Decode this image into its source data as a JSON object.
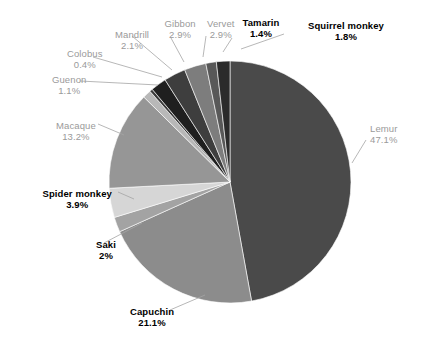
{
  "chart_data": {
    "type": "pie",
    "title": "",
    "subtitle": "",
    "xlabel": "",
    "ylabel": "",
    "legend_position": "none",
    "grid": false,
    "units": "percent",
    "categories": [
      "Lemur",
      "Capuchin",
      "Macaque",
      "Spider monkey",
      "Gibbon",
      "Vervet",
      "Mandrill",
      "Saki",
      "Squirrel monkey",
      "Tamarin",
      "Guenon",
      "Colobus"
    ],
    "values": [
      47.1,
      21.1,
      13.2,
      3.9,
      2.9,
      2.9,
      2.1,
      2,
      1.8,
      1.4,
      1.1,
      0.4
    ],
    "slices": [
      {
        "name": "Lemur",
        "value": 47.1,
        "label": "Lemur",
        "percent": "47.1%",
        "color": "#4a4a4a",
        "label_style": "gray"
      },
      {
        "name": "Capuchin",
        "value": 21.1,
        "label": "Capuchin",
        "percent": "21.1%",
        "color": "#8c8c8c",
        "label_style": "bold"
      },
      {
        "name": "Saki",
        "value": 2,
        "label": "Saki",
        "percent": "2%",
        "color": "#a3a3a3",
        "label_style": "bold"
      },
      {
        "name": "Spider monkey",
        "value": 3.9,
        "label": "Spider monkey",
        "percent": "3.9%",
        "color": "#d6d6d6",
        "label_style": "bold"
      },
      {
        "name": "Macaque",
        "value": 13.2,
        "label": "Macaque",
        "percent": "13.2%",
        "color": "#969696",
        "label_style": "gray"
      },
      {
        "name": "Guenon",
        "value": 1.1,
        "label": "Guenon",
        "percent": "1.1%",
        "color": "#b8b8b8",
        "label_style": "gray"
      },
      {
        "name": "Colobus",
        "value": 0.4,
        "label": "Colobus",
        "percent": "0.4%",
        "color": "#3a3a3a",
        "label_style": "gray"
      },
      {
        "name": "Mandrill",
        "value": 2.1,
        "label": "Mandrill",
        "percent": "2.1%",
        "color": "#1f1f1f",
        "label_style": "gray"
      },
      {
        "name": "Gibbon",
        "value": 2.9,
        "label": "Gibbon",
        "percent": "2.9%",
        "color": "#3e3e3e",
        "label_style": "gray"
      },
      {
        "name": "Vervet",
        "value": 2.9,
        "label": "Vervet",
        "percent": "2.9%",
        "color": "#7d7d7d",
        "label_style": "gray"
      },
      {
        "name": "Tamarin",
        "value": 1.4,
        "label": "Tamarin",
        "percent": "1.4%",
        "color": "#585858",
        "label_style": "bold"
      },
      {
        "name": "Squirrel monkey",
        "value": 1.8,
        "label": "Squirrel monkey",
        "percent": "1.8%",
        "color": "#2b2b2b",
        "label_style": "bold"
      }
    ]
  },
  "geometry": {
    "cx": 230,
    "cy": 182,
    "r": 121,
    "start_angle_deg": 0,
    "direction": "clockwise"
  },
  "labels": [
    {
      "key": "lemur",
      "name": "Lemur",
      "percent": "47.1%",
      "style": "gray",
      "x": 370,
      "y": 123,
      "anchor": "left",
      "leader": [
        [
          366,
          140
        ],
        [
          352,
          163
        ]
      ]
    },
    {
      "key": "capuchin",
      "name": "Capuchin",
      "percent": "21.1%",
      "style": "bold",
      "x": 122,
      "y": 306,
      "anchor": "center",
      "leader": [
        [
          170,
          310
        ],
        [
          205,
          295
        ]
      ]
    },
    {
      "key": "saki",
      "name": "Saki",
      "percent": "2%",
      "style": "bold",
      "x": 76,
      "y": 239,
      "anchor": "center",
      "leader": [
        [
          104,
          243
        ],
        [
          142,
          223
        ]
      ]
    },
    {
      "key": "spider-monkey",
      "name": "Spider monkey",
      "percent": "3.9%",
      "style": "bold",
      "x": 47,
      "y": 188,
      "anchor": "center",
      "leader": [
        [
          118,
          192
        ],
        [
          134,
          199
        ]
      ]
    },
    {
      "key": "macaque",
      "name": "Macaque",
      "percent": "13.2%",
      "style": "gray",
      "x": 46,
      "y": 120,
      "anchor": "center",
      "leader": [
        [
          98,
          124
        ],
        [
          124,
          135
        ]
      ]
    },
    {
      "key": "guenon",
      "name": "Guenon",
      "percent": "1.1%",
      "style": "gray",
      "x": 39,
      "y": 74,
      "anchor": "center",
      "leader": [
        [
          80,
          81
        ],
        [
          158,
          85
        ]
      ]
    },
    {
      "key": "colobus",
      "name": "Colobus",
      "percent": "0.4%",
      "style": "gray",
      "x": 55,
      "y": 48,
      "anchor": "center",
      "leader": [
        [
          93,
          57
        ],
        [
          162,
          77
        ]
      ]
    },
    {
      "key": "mandrill",
      "name": "Mandrill",
      "percent": "2.1%",
      "style": "gray",
      "x": 102,
      "y": 29,
      "anchor": "center",
      "leader": [
        [
          132,
          36
        ],
        [
          172,
          70
        ]
      ]
    },
    {
      "key": "gibbon",
      "name": "Gibbon",
      "percent": "2.9%",
      "style": "gray",
      "x": 150,
      "y": 18,
      "anchor": "center",
      "leader": [
        [
          171,
          38
        ],
        [
          184,
          62
        ]
      ]
    },
    {
      "key": "vervet",
      "name": "Vervet",
      "percent": "2.9%",
      "style": "gray",
      "x": 191,
      "y": 18,
      "anchor": "center",
      "leader": [
        [
          206,
          36
        ],
        [
          203,
          57
        ]
      ]
    },
    {
      "key": "tamarin",
      "name": "Tamarin",
      "percent": "1.4%",
      "style": "bold",
      "x": 231,
      "y": 17,
      "anchor": "center",
      "leader": [
        [
          232,
          38
        ],
        [
          223,
          52
        ]
      ]
    },
    {
      "key": "squirrel-monkey",
      "name": "Squirrel monkey",
      "percent": "1.8%",
      "style": "bold",
      "x": 316,
      "y": 20,
      "anchor": "center",
      "leader": [
        [
          284,
          34
        ],
        [
          241,
          49
        ]
      ]
    }
  ]
}
